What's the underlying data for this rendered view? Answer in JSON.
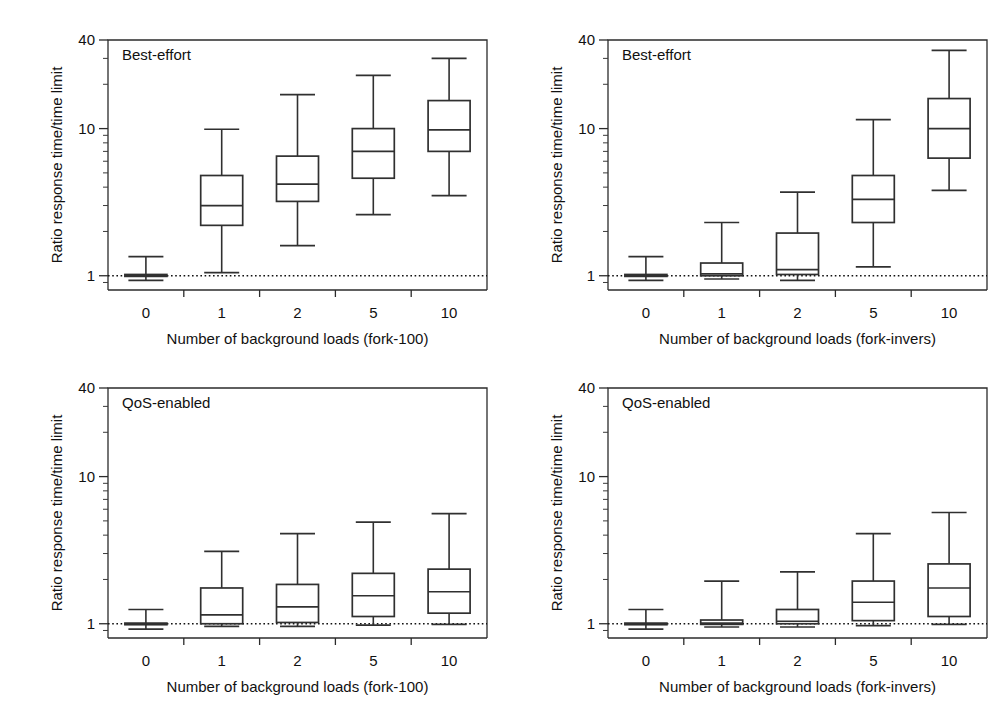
{
  "figure": {
    "background": "#ffffff",
    "ink_color": "#303030",
    "panel_count": 4
  },
  "chart_data": [
    {
      "id": "top-left",
      "type": "box",
      "panel_label": "Best-effort",
      "title": "",
      "xlabel": "Number of background loads (fork-100)",
      "ylabel": "Ratio response time/time limit",
      "yscale": "log",
      "ylim": [
        0.8,
        40
      ],
      "ytick_labels": [
        "1",
        "10",
        "40"
      ],
      "ytick_values": [
        1,
        10,
        40
      ],
      "categories": [
        "0",
        "1",
        "2",
        "5",
        "10"
      ],
      "grid": false,
      "legend": "none",
      "reference_line": {
        "y": 1.0,
        "style": "dotted"
      },
      "boxes": [
        {
          "category": "0",
          "whisker_low": 0.93,
          "q1": 0.99,
          "median": 1.0,
          "q3": 1.02,
          "whisker_high": 1.35
        },
        {
          "category": "1",
          "whisker_low": 1.05,
          "q1": 2.2,
          "median": 3.0,
          "q3": 4.8,
          "whisker_high": 9.9
        },
        {
          "category": "2",
          "whisker_low": 1.6,
          "q1": 3.2,
          "median": 4.2,
          "q3": 6.5,
          "whisker_high": 17.0
        },
        {
          "category": "5",
          "whisker_low": 2.6,
          "q1": 4.6,
          "median": 7.0,
          "q3": 10.0,
          "whisker_high": 23.0
        },
        {
          "category": "10",
          "whisker_low": 3.5,
          "q1": 7.0,
          "median": 9.8,
          "q3": 15.5,
          "whisker_high": 30.0
        }
      ]
    },
    {
      "id": "top-right",
      "type": "box",
      "panel_label": "Best-effort",
      "title": "",
      "xlabel": "Number of background loads (fork-invers)",
      "ylabel": "Ratio response time/time limit",
      "yscale": "log",
      "ylim": [
        0.8,
        40
      ],
      "ytick_labels": [
        "1",
        "10",
        "40"
      ],
      "ytick_values": [
        1,
        10,
        40
      ],
      "categories": [
        "0",
        "1",
        "2",
        "5",
        "10"
      ],
      "grid": false,
      "legend": "none",
      "reference_line": {
        "y": 1.0,
        "style": "dotted"
      },
      "boxes": [
        {
          "category": "0",
          "whisker_low": 0.93,
          "q1": 0.99,
          "median": 1.0,
          "q3": 1.02,
          "whisker_high": 1.35
        },
        {
          "category": "1",
          "whisker_low": 0.95,
          "q1": 1.0,
          "median": 1.03,
          "q3": 1.22,
          "whisker_high": 2.3
        },
        {
          "category": "2",
          "whisker_low": 0.93,
          "q1": 1.02,
          "median": 1.1,
          "q3": 1.95,
          "whisker_high": 3.7
        },
        {
          "category": "5",
          "whisker_low": 1.15,
          "q1": 2.3,
          "median": 3.3,
          "q3": 4.8,
          "whisker_high": 11.5
        },
        {
          "category": "10",
          "whisker_low": 3.8,
          "q1": 6.3,
          "median": 10.0,
          "q3": 16.0,
          "whisker_high": 34.0
        }
      ]
    },
    {
      "id": "bottom-left",
      "type": "box",
      "panel_label": "QoS-enabled",
      "title": "",
      "xlabel": "Number of background loads (fork-100)",
      "ylabel": "Ratio response time/time limit",
      "yscale": "log",
      "ylim": [
        0.8,
        40
      ],
      "ytick_labels": [
        "1",
        "10",
        "40"
      ],
      "ytick_values": [
        1,
        10,
        40
      ],
      "categories": [
        "0",
        "1",
        "2",
        "5",
        "10"
      ],
      "grid": false,
      "legend": "none",
      "reference_line": {
        "y": 1.0,
        "style": "dotted"
      },
      "boxes": [
        {
          "category": "0",
          "whisker_low": 0.92,
          "q1": 0.99,
          "median": 1.0,
          "q3": 1.01,
          "whisker_high": 1.25
        },
        {
          "category": "1",
          "whisker_low": 0.96,
          "q1": 1.0,
          "median": 1.15,
          "q3": 1.75,
          "whisker_high": 3.1
        },
        {
          "category": "2",
          "whisker_low": 0.96,
          "q1": 1.02,
          "median": 1.3,
          "q3": 1.85,
          "whisker_high": 4.1
        },
        {
          "category": "5",
          "whisker_low": 0.98,
          "q1": 1.12,
          "median": 1.55,
          "q3": 2.2,
          "whisker_high": 4.9
        },
        {
          "category": "10",
          "whisker_low": 0.99,
          "q1": 1.18,
          "median": 1.65,
          "q3": 2.35,
          "whisker_high": 5.6
        }
      ]
    },
    {
      "id": "bottom-right",
      "type": "box",
      "panel_label": "QoS-enabled",
      "title": "",
      "xlabel": "Number of background loads (fork-invers)",
      "ylabel": "Ratio response time/time limit",
      "yscale": "log",
      "ylim": [
        0.8,
        40
      ],
      "ytick_labels": [
        "1",
        "10",
        "40"
      ],
      "ytick_values": [
        1,
        10,
        40
      ],
      "categories": [
        "0",
        "1",
        "2",
        "5",
        "10"
      ],
      "grid": false,
      "legend": "none",
      "reference_line": {
        "y": 1.0,
        "style": "dotted"
      },
      "boxes": [
        {
          "category": "0",
          "whisker_low": 0.92,
          "q1": 0.99,
          "median": 1.0,
          "q3": 1.01,
          "whisker_high": 1.25
        },
        {
          "category": "1",
          "whisker_low": 0.95,
          "q1": 0.99,
          "median": 1.01,
          "q3": 1.06,
          "whisker_high": 1.95
        },
        {
          "category": "2",
          "whisker_low": 0.95,
          "q1": 1.0,
          "median": 1.04,
          "q3": 1.25,
          "whisker_high": 2.25
        },
        {
          "category": "5",
          "whisker_low": 0.97,
          "q1": 1.05,
          "median": 1.4,
          "q3": 1.95,
          "whisker_high": 4.1
        },
        {
          "category": "10",
          "whisker_low": 0.99,
          "q1": 1.12,
          "median": 1.75,
          "q3": 2.55,
          "whisker_high": 5.7
        }
      ]
    }
  ]
}
